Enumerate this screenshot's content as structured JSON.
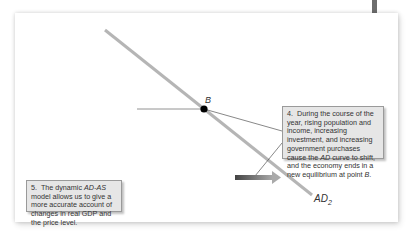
{
  "diagram": {
    "curve_label": "AD",
    "curve_subscript": "2",
    "point_label": "B",
    "callouts": [
      {
        "number": "4.",
        "text_parts": [
          "During the course of the year, rising population and income, increasing investment, and increasing government purchases cause the ",
          "AD",
          " curve to shift, and the economy ends in a new equilibrium at point ",
          "B",
          "."
        ]
      },
      {
        "number": "5.",
        "text_parts": [
          "The dynamic ",
          "AD-AS",
          " model allows us to give a more accurate account of changes in real GDP and the price level."
        ]
      }
    ],
    "colors": {
      "curve": "#b5b5b5",
      "point": "#000000",
      "callout_bg": "#e6e6e6",
      "arrow_start": "#444444",
      "arrow_end": "#a8a8a8"
    }
  }
}
